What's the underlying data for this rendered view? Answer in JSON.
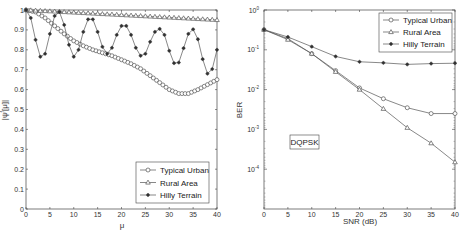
{
  "chart_data": [
    {
      "type": "line",
      "title": "",
      "xlabel": "μ",
      "ylabel": "|ψ^f[μ]|",
      "xlim": [
        0,
        40
      ],
      "ylim": [
        0,
        1
      ],
      "xticks": [
        "0",
        "5",
        "10",
        "15",
        "20",
        "25",
        "30",
        "35",
        "40"
      ],
      "yticks": [
        "0",
        "0.1",
        "0.2",
        "0.3",
        "0.4",
        "0.5",
        "0.6",
        "0.7",
        "0.8",
        "0.9",
        "1"
      ],
      "grid": false,
      "legend_position": "lower right",
      "series": [
        {
          "name": "Typical Urban",
          "marker": "circle",
          "x": [
            0,
            2,
            4,
            6,
            8,
            10,
            12,
            14,
            16,
            18,
            20,
            22,
            24,
            26,
            28,
            30,
            32,
            34,
            36,
            38,
            40
          ],
          "values": [
            1.0,
            0.99,
            0.96,
            0.92,
            0.88,
            0.845,
            0.82,
            0.8,
            0.785,
            0.77,
            0.75,
            0.73,
            0.705,
            0.67,
            0.635,
            0.6,
            0.58,
            0.58,
            0.6,
            0.625,
            0.65
          ]
        },
        {
          "name": "Rural Area",
          "marker": "triangle",
          "x": [
            0,
            40
          ],
          "values": [
            1.0,
            0.95
          ]
        },
        {
          "name": "Hilly Terrain",
          "marker": "star",
          "x": [
            0,
            1,
            2,
            3,
            4,
            5,
            6,
            7,
            8,
            9,
            10,
            11,
            12,
            13,
            14,
            15,
            16,
            17,
            18,
            19,
            20,
            21,
            22,
            23,
            24,
            25,
            26,
            27,
            28,
            29,
            30,
            31,
            32,
            33,
            34,
            35,
            36,
            37,
            38,
            39,
            40
          ],
          "values": [
            1.0,
            0.96,
            0.85,
            0.765,
            0.78,
            0.88,
            0.97,
            0.99,
            0.925,
            0.825,
            0.765,
            0.8,
            0.89,
            0.953,
            0.953,
            0.89,
            0.815,
            0.78,
            0.81,
            0.875,
            0.92,
            0.92,
            0.875,
            0.81,
            0.77,
            0.78,
            0.84,
            0.89,
            0.905,
            0.875,
            0.795,
            0.733,
            0.736,
            0.808,
            0.88,
            0.903,
            0.853,
            0.753,
            0.68,
            0.703,
            0.8
          ]
        }
      ]
    },
    {
      "type": "line",
      "title": "",
      "xlabel": "SNR (dB)",
      "ylabel": "BER",
      "yscale": "log",
      "xlim": [
        0,
        40
      ],
      "ylim": [
        1e-05,
        1
      ],
      "xticks": [
        "0",
        "5",
        "10",
        "15",
        "20",
        "25",
        "30",
        "35",
        "40"
      ],
      "yticks": [
        "10^0",
        "10^-1",
        "10^-2",
        "10^-3",
        "10^-4"
      ],
      "grid": false,
      "legend_position": "upper right",
      "annotation": "DQPSK",
      "categories": [
        0,
        5,
        10,
        15,
        20,
        25,
        30,
        35,
        40
      ],
      "series": [
        {
          "name": "Typical Urban",
          "marker": "circle",
          "values": [
            0.32,
            0.19,
            0.08,
            0.03,
            0.011,
            0.0059,
            0.0035,
            0.0025,
            0.0025
          ]
        },
        {
          "name": "Rural Area",
          "marker": "triangle",
          "values": [
            0.32,
            0.18,
            0.08,
            0.028,
            0.01,
            0.0033,
            0.0011,
            0.00045,
            0.00015
          ]
        },
        {
          "name": "Hilly Terrain",
          "marker": "star",
          "values": [
            0.32,
            0.21,
            0.12,
            0.068,
            0.05,
            0.047,
            0.043,
            0.045,
            0.046
          ]
        }
      ]
    }
  ],
  "left": {
    "ylabel": "|ψ",
    "ylabel_sup": "f",
    "ylabel_end": "[μ]|",
    "xlabel": "μ",
    "legend": [
      "Typical Urban",
      "Rural Area",
      "Hilly Terrain"
    ]
  },
  "right": {
    "ylabel": "BER",
    "xlabel": "SNR (dB)",
    "annotation": "DQPSK",
    "legend": [
      "Typical Urban",
      "Rural Area",
      "Hilly Terrain"
    ]
  }
}
